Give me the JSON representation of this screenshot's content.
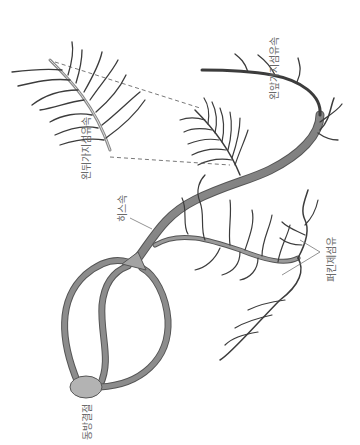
{
  "diagram": {
    "colors": {
      "bundle_fill": "#8c8c8c",
      "bundle_stroke": "#555555",
      "node_fill": "#b3b3b3",
      "fiber_stroke": "#3c3c3c",
      "label_color": "#6a6a6a",
      "leader_line": "#777777"
    },
    "labels": {
      "sa_node": "동방결절",
      "his_bundle": "히스속",
      "left_posterior_fascicle": "왼뒤가지섬유속",
      "left_anterior_fascicle": "왼앞가지섬유속",
      "purkinje_fibers": "퍼킨제섬유"
    }
  }
}
